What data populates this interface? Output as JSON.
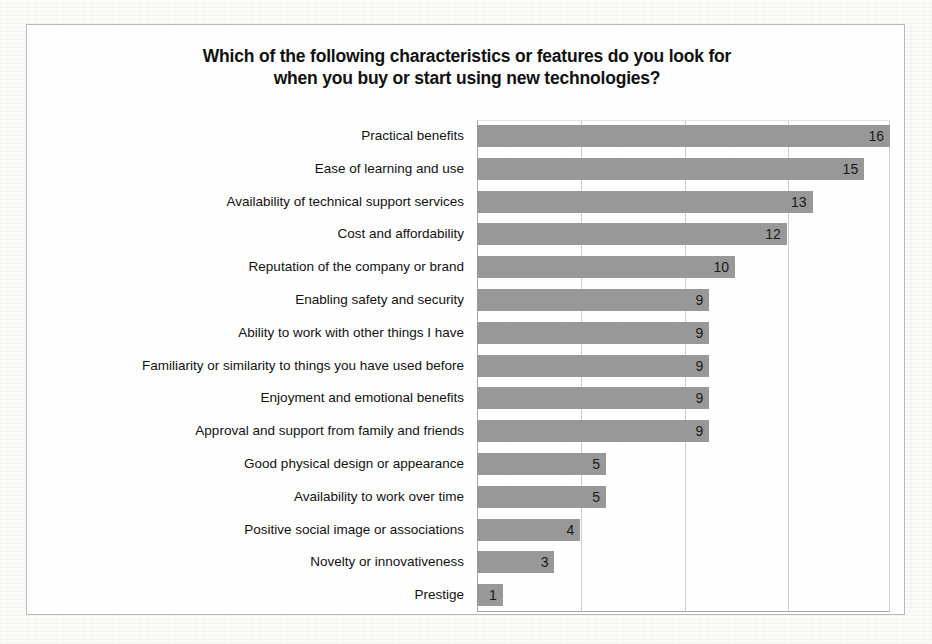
{
  "chart_data": {
    "type": "bar",
    "orientation": "horizontal",
    "title": "Which of the following characteristics or features do you look for\nwhen you buy or start using new technologies?",
    "xlabel": "",
    "ylabel": "",
    "xlim": [
      0,
      16
    ],
    "grid": true,
    "gridlines": [
      0,
      4,
      8,
      12,
      16
    ],
    "legend": "none",
    "bar_color": "#989898",
    "categories": [
      "Practical benefits",
      "Ease of learning and use",
      "Availability of technical support services",
      "Cost and affordability",
      "Reputation of the company or brand",
      "Enabling safety and security",
      "Ability to work with other things I have",
      "Familiarity or similarity to things you have used before",
      "Enjoyment and emotional benefits",
      "Approval and support from family and friends",
      "Good physical design or appearance",
      "Availability to work over time",
      "Positive social image or associations",
      "Novelty or innovativeness",
      "Prestige"
    ],
    "values": [
      16,
      15,
      13,
      12,
      10,
      9,
      9,
      9,
      9,
      9,
      5,
      5,
      4,
      3,
      1
    ],
    "data_labels": [
      "16",
      "15",
      "13",
      "12",
      "10",
      "9",
      "9",
      "9",
      "9",
      "9",
      "5",
      "5",
      "4",
      "3",
      "1"
    ]
  }
}
